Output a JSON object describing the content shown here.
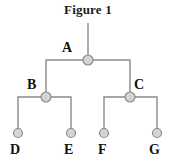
{
  "figure": {
    "title": "Figure 1",
    "type": "binary-tree-diagram"
  },
  "colors": {
    "node_fill": "#d4d4d4",
    "node_stroke": "#8a8a8a",
    "edge": "#8a8a8a",
    "label": "#111111",
    "title": "#1a1a1a",
    "background": "#ffffff"
  },
  "tree": {
    "root_stem": {
      "x": 88,
      "y_top": 23,
      "y_bottom": 60
    },
    "nodes": [
      {
        "id": "A",
        "label": "A",
        "cx": 88,
        "cy": 60,
        "r": 5,
        "level": 0,
        "label_x": 62,
        "label_y": 41
      },
      {
        "id": "B",
        "label": "B",
        "cx": 46,
        "cy": 97,
        "r": 5,
        "level": 1,
        "label_x": 27,
        "label_y": 78
      },
      {
        "id": "C",
        "label": "C",
        "cx": 130,
        "cy": 97,
        "r": 5,
        "level": 1,
        "label_x": 134,
        "label_y": 78
      },
      {
        "id": "D",
        "label": "D",
        "cx": 18,
        "cy": 133,
        "r": 4.5,
        "level": 2,
        "label_x": 10,
        "label_y": 143
      },
      {
        "id": "E",
        "label": "E",
        "cx": 71,
        "cy": 133,
        "r": 4.5,
        "level": 2,
        "label_x": 64,
        "label_y": 143
      },
      {
        "id": "F",
        "label": "F",
        "cx": 104,
        "cy": 133,
        "r": 4.5,
        "level": 2,
        "label_x": 98,
        "label_y": 143
      },
      {
        "id": "G",
        "label": "G",
        "cx": 157,
        "cy": 133,
        "r": 4.5,
        "level": 2,
        "label_x": 149,
        "label_y": 143
      }
    ],
    "edges": [
      {
        "from": "A",
        "to": "B",
        "style": "orthogonal"
      },
      {
        "from": "A",
        "to": "C",
        "style": "orthogonal"
      },
      {
        "from": "B",
        "to": "D",
        "style": "orthogonal"
      },
      {
        "from": "B",
        "to": "E",
        "style": "orthogonal"
      },
      {
        "from": "C",
        "to": "F",
        "style": "orthogonal"
      },
      {
        "from": "C",
        "to": "G",
        "style": "orthogonal"
      }
    ]
  }
}
